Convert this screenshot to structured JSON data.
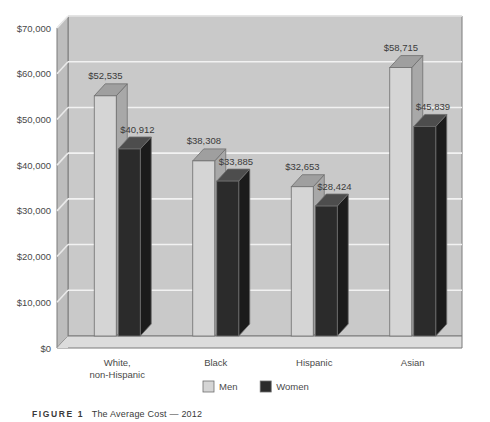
{
  "chart_data": {
    "type": "bar",
    "title": "",
    "subtitle": "",
    "xlabel": "",
    "ylabel": "",
    "ylim": [
      0,
      70000
    ],
    "ytick_values": [
      0,
      10000,
      20000,
      30000,
      40000,
      50000,
      60000,
      70000
    ],
    "ytick_labels": [
      "$0",
      "$10,000",
      "$20,000",
      "$30,000",
      "$40,000",
      "$50,000",
      "$60,000",
      "$70,000"
    ],
    "grid": true,
    "legend_position": "bottom-center",
    "categories": [
      "White, non-Hispanic",
      "Black",
      "Hispanic",
      "Asian"
    ],
    "category_lines": [
      [
        "White,",
        "non-Hispanic"
      ],
      [
        "Black"
      ],
      [
        "Hispanic"
      ],
      [
        "Asian"
      ]
    ],
    "series": [
      {
        "name": "Men",
        "color": "#d5d5d5",
        "values": [
          52535,
          38308,
          32653,
          58715
        ],
        "labels": [
          "$52,535",
          "$38,308",
          "$32,653",
          "$58,715"
        ]
      },
      {
        "name": "Women",
        "color": "#2b2b2b",
        "values": [
          40912,
          33885,
          28424,
          45839
        ],
        "labels": [
          "$40,912",
          "$33,885",
          "$28,424",
          "$45,839"
        ]
      }
    ]
  },
  "legend": {
    "items": [
      {
        "label": "Men",
        "color": "#d5d5d5"
      },
      {
        "label": "Women",
        "color": "#2b2b2b"
      }
    ]
  },
  "caption": {
    "figure_number": "FIGURE 1",
    "text": "The Average Cost — 2012"
  },
  "colors": {
    "page_background": "#ffffff",
    "plot_wall": "#c9c9c9",
    "plot_floor": "#dadada",
    "side_wall": "#bdbdbd",
    "gridline": "#f2f2f2",
    "men_front": "#d5d5d5",
    "men_top": "#9f9f9f",
    "men_side": "#a8a8a8",
    "women_front": "#2b2b2b",
    "women_top": "#4d4d4d",
    "women_side": "#1b1b1b",
    "outline": "#6e6e6e",
    "text": "#4a4a4a"
  }
}
